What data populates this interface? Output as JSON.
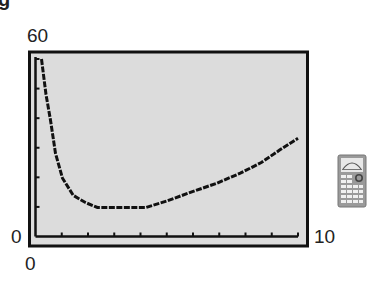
{
  "figure": {
    "label_fragment": "g",
    "window": {
      "xmin_label": "0",
      "xmax_label": "10",
      "ymin_label": "0",
      "ymax_label": "60"
    },
    "icon": "graphing-calculator-icon"
  },
  "colors": {
    "screen_bg": "#dcdcdc",
    "frame": "#111111",
    "curve": "#111111"
  },
  "chart_data": {
    "type": "line",
    "title": "",
    "xlabel": "",
    "ylabel": "",
    "xlim": [
      0,
      10
    ],
    "ylim": [
      0,
      60
    ],
    "x_ticks_count": 10,
    "y_ticks_count": 6,
    "grid": false,
    "legend": null,
    "tick_labels": {
      "x": [
        "0",
        "10"
      ],
      "y": [
        "0",
        "60"
      ]
    },
    "series": [
      {
        "name": "curve",
        "x": [
          0.23,
          0.4,
          0.57,
          0.76,
          1.03,
          1.44,
          1.9,
          2.36,
          3.0,
          3.6,
          4.2,
          5.0,
          5.9,
          6.9,
          7.8,
          8.6,
          9.3,
          10.0
        ],
        "y": [
          60,
          48,
          39.3,
          28.1,
          19.7,
          13.9,
          11.5,
          9.8,
          9.8,
          9.8,
          9.8,
          12.0,
          14.9,
          18.0,
          21.4,
          25.0,
          29.2,
          33.2
        ]
      }
    ]
  }
}
